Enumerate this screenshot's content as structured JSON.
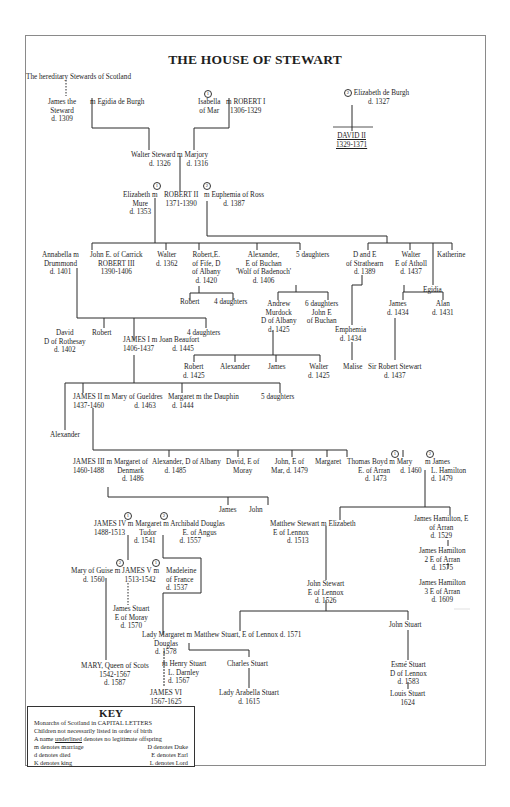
{
  "title": "THE HOUSE OF STEWART",
  "nodes": {
    "hereditary": "The hereditary Stewards of Scotland",
    "james_steward": [
      "James the",
      "Steward",
      "d. 1309"
    ],
    "egidia": "m Egidia de Burgh",
    "isabella": [
      "Isabella",
      "of Mar"
    ],
    "robert1": [
      "m ROBERT I",
      "1306-1329"
    ],
    "elizabeth_burgh": [
      "Elizabeth de Burgh",
      "d. 1327"
    ],
    "david2": [
      "DAVID II",
      "1329-1371"
    ],
    "walter_steward": [
      "Walter Steward m Marjory",
      "d. 1326",
      "d. 1316"
    ],
    "elizabeth_mure": [
      "Elizabeth m",
      "Mure",
      "d. 1353"
    ],
    "robert2": [
      "ROBERT II",
      "1371-1390"
    ],
    "euphemia": [
      "m Euphemia of Ross",
      "d. 1387"
    ],
    "annabella": [
      "Annabella m",
      "Drummond",
      "d. 1401"
    ],
    "robert3": [
      "John E. of Carrick",
      "ROBERT III",
      "1390-1406"
    ],
    "walter1362": [
      "Walter",
      "d. 1362"
    ],
    "robert_albany": [
      "Robert,E.",
      "of Fife, D",
      "of Albany",
      "d. 1420"
    ],
    "alexander_buchan": [
      "Alexander,",
      "E of Buchan",
      "'Wolf of Badenoch'",
      "d. 1406"
    ],
    "five_daughters_a": "5 daughters",
    "d_strathearn": [
      "D and E",
      "of Strathearn",
      "d. 1389"
    ],
    "walter_atholl": [
      "Walter",
      "E of Atholl",
      "d. 1437"
    ],
    "katherine": "Katherine",
    "egidia2": "Egidia",
    "robert_b": "Robert",
    "four_daughters_a": "4 daughters",
    "murdock": [
      "Andrew",
      "Murdock",
      "D of Albany",
      "d. 1425"
    ],
    "six_daughters": [
      "6 daughters",
      "John E",
      "of Buchan"
    ],
    "james1434": [
      "James",
      "d. 1434"
    ],
    "alan1431": [
      "Alan",
      "d. 1431"
    ],
    "david_rothesay": [
      "David",
      "D of Rothesay",
      "d. 1402"
    ],
    "robert_c": "Robert",
    "james1": [
      "JAMES I m Joan Beaufort",
      "1406-1437",
      "d. 1445"
    ],
    "four_daughters_b": "4 daughters",
    "emphemia": [
      "Emphemia",
      "d. 1434"
    ],
    "robert1425": [
      "Robert",
      "d. 1425"
    ],
    "alexander_m": "Alexander",
    "james_m": "James",
    "walter1425": [
      "Walter",
      "d. 1425"
    ],
    "malise": "Malise",
    "sir_robert": [
      "Sir Robert Stewart",
      "d. 1437"
    ],
    "james2": [
      "JAMES II m Mary of Gueldres",
      "1437-1460",
      "d. 1463"
    ],
    "margaret_dauphin": [
      "Margaret m the Dauphin",
      "d. 1444"
    ],
    "five_daughters_b": "5 daughters",
    "alexander_j2": "Alexander",
    "james3": [
      "JAMES III m Margaret of",
      "1460-1488",
      "Denmark",
      "d. 1486"
    ],
    "alexander_albany": [
      "Alexander, D of Albany",
      "d. 1485"
    ],
    "david_moray": [
      "David, E of",
      "Moray"
    ],
    "john_mar": [
      "John, E of",
      "Mar, d. 1479"
    ],
    "margaret_b": "Margaret",
    "thomas_boyd": [
      "Thomas Boyd m Mary",
      "E. of Arran",
      "d. 1473",
      "d. 1460"
    ],
    "james_hamilton_l": [
      "m James",
      "L. Hamilton",
      "d. 1479"
    ],
    "james4": [
      "JAMES IV m Margaret m Archibald Douglas",
      "1488-1513",
      "Tudor",
      "d. 1541",
      "E. of Angus",
      "d. 1557"
    ],
    "james_b": "James",
    "john_b": "John",
    "matthew_stewart": [
      "Matthew Stewart m Elizabeth",
      "E of Lennox",
      "d. 1513"
    ],
    "hamilton1": [
      "James Hamilton, E",
      "of Arran",
      "d. 1529"
    ],
    "hamilton2": [
      "James Hamilton",
      "2 E of Arran",
      "d. 1575"
    ],
    "hamilton3": [
      "James Hamilton",
      "3 E of Arran",
      "d. 1609"
    ],
    "mary_guise": [
      "Mary of Guise m JAMES V m",
      "d. 1560",
      "1513-1542"
    ],
    "madeleine": [
      "Madeleine",
      "of France",
      "d. 1537"
    ],
    "john_stewart_lennox": [
      "John Stewart",
      "E of Lennox",
      "d. 1526"
    ],
    "james_stuart_moray": [
      "James Stuart",
      "E of Moray",
      "d. 1570"
    ],
    "lady_margaret": [
      "Lady Margaret m Matthew Stuart, E of Lennox d. 1571",
      "Douglas",
      "d. 1578"
    ],
    "john_stuart": "John Stuart",
    "henry_darnley": [
      "m Henry Stuart",
      "L. Darnley",
      "d. 1567"
    ],
    "charles_stuart": "Charles Stuart",
    "esme_stuart": [
      "Esmé Stuart",
      "D of Lennox",
      "d. 1583"
    ],
    "mary_qos": [
      "MARY, Queen of Scots",
      "1542-1567",
      "d. 1587"
    ],
    "james6": [
      "JAMES VI",
      "1567-1625"
    ],
    "arabella": [
      "Lady Arabella Stuart",
      "d. 1615"
    ],
    "louis_stuart": [
      "Louis Stuart",
      "1624"
    ]
  },
  "key": {
    "title": "KEY",
    "lines": [
      "Monarchs of Scotland in CAPITAL LETTERS",
      "Children not necessarily listed in order of birth",
      "denotes no legitimate offspring"
    ],
    "underline_prefix": "A name",
    "underline_word": "underlined",
    "pairs": [
      [
        "m  denotes marriage",
        "D  denotes Duke"
      ],
      [
        "d  denotes died",
        "E  denotes Earl"
      ],
      [
        "K  denotes king",
        "L  denotes Lord"
      ]
    ]
  },
  "marriage_marks": [
    "1",
    "2"
  ]
}
